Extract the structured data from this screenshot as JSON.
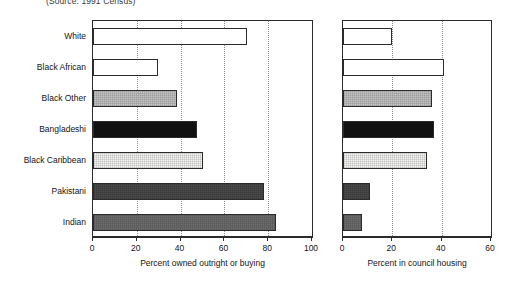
{
  "figure": {
    "source_note": "(Source: 1991 Census)"
  },
  "chart_data": {
    "type": "bar",
    "orientation": "horizontal",
    "title": "",
    "subtitle": "(Source: 1991 Census)",
    "categories": [
      "White",
      "Black African",
      "Black Other",
      "Bangladeshi",
      "Black Caribbean",
      "Pakistani",
      "Indian"
    ],
    "grid": true,
    "legend": "none",
    "panels": [
      {
        "id": "owned",
        "xlabel": "Percent owned outright or buying",
        "ylabel": "",
        "xlim": [
          0,
          100
        ],
        "xticks": [
          0,
          20,
          40,
          60,
          80,
          100
        ],
        "xticklabels": [
          "0",
          "20",
          "40",
          "60",
          "80",
          "100"
        ],
        "values": [
          70.5,
          29.5,
          38.5,
          47.5,
          50.0,
          78.0,
          83.5
        ],
        "fills": [
          "white",
          "white",
          "medium-gray",
          "black",
          "very-light-gray",
          "dark-gray",
          "gray"
        ]
      },
      {
        "id": "council",
        "xlabel": "Percent in council housing",
        "ylabel": "",
        "xlim": [
          0,
          60
        ],
        "xticks": [
          0,
          20,
          40,
          60
        ],
        "xticklabels": [
          "0",
          "20",
          "40",
          "60"
        ],
        "values": [
          19.8,
          41.0,
          36.0,
          37.0,
          34.0,
          11.0,
          7.7
        ],
        "fills": [
          "white",
          "white",
          "medium-gray",
          "black",
          "very-light-gray",
          "dark-gray",
          "gray"
        ]
      }
    ]
  }
}
